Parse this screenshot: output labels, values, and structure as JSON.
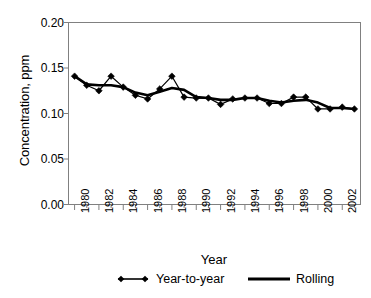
{
  "chart_data": {
    "type": "line",
    "title": "",
    "xlabel": "Year",
    "ylabel": "Concentration, ppm",
    "x": [
      1980,
      1981,
      1982,
      1983,
      1984,
      1985,
      1986,
      1987,
      1988,
      1989,
      1990,
      1991,
      1992,
      1993,
      1994,
      1995,
      1996,
      1997,
      1998,
      1999,
      2000,
      2001,
      2002,
      2003
    ],
    "xlim": [
      1979.5,
      2003.5
    ],
    "ylim": [
      0.0,
      0.2
    ],
    "ytick_values": [
      0.0,
      0.05,
      0.1,
      0.15,
      0.2
    ],
    "ytick_labels": [
      "0.00",
      "0.05",
      "0.10",
      "0.15",
      "0.20"
    ],
    "xtick_labels": [
      "1980",
      "1982",
      "1984",
      "1986",
      "1988",
      "1990",
      "1992",
      "1994",
      "1996",
      "1998",
      "2000",
      "2002"
    ],
    "xtick_values": [
      1980,
      1982,
      1984,
      1986,
      1988,
      1990,
      1992,
      1994,
      1996,
      1998,
      2000,
      2002
    ],
    "xtick_minor_every": 1,
    "grid": false,
    "legend_position": "below-axes",
    "series": [
      {
        "name": "Year-to-year",
        "marker": "diamond",
        "color": "#000000",
        "values": [
          0.141,
          0.131,
          0.125,
          0.141,
          0.129,
          0.12,
          0.116,
          0.127,
          0.141,
          0.118,
          0.117,
          0.117,
          0.11,
          0.116,
          0.117,
          0.117,
          0.111,
          0.111,
          0.118,
          0.118,
          0.105,
          0.105,
          0.107,
          0.105
        ]
      },
      {
        "name": "Rolling",
        "marker": "none",
        "color": "#000000",
        "values": [
          0.141,
          0.132,
          0.131,
          0.131,
          0.129,
          0.123,
          0.12,
          0.124,
          0.128,
          0.126,
          0.118,
          0.117,
          0.115,
          0.115,
          0.117,
          0.117,
          0.114,
          0.112,
          0.114,
          0.115,
          0.112,
          0.106,
          0.106,
          0.105
        ]
      }
    ]
  },
  "axes": {
    "y_axis_title": "Concentration, ppm",
    "x_axis_title": "Year"
  },
  "legend": {
    "items": [
      {
        "label": "Year-to-year",
        "style": "line-with-diamond-markers"
      },
      {
        "label": "Rolling",
        "style": "thick-line"
      }
    ]
  },
  "colors": {
    "series": "#000000",
    "axis": "#808080",
    "background": "#ffffff"
  }
}
